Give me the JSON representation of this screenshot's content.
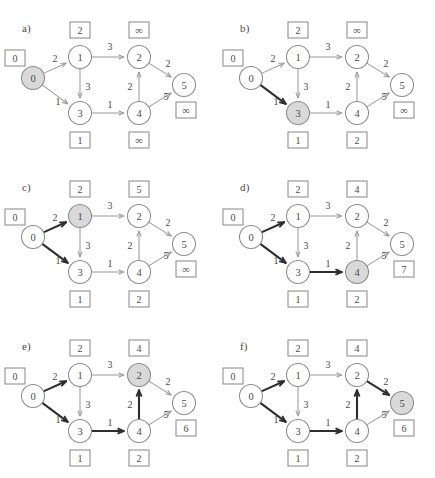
{
  "figure": {
    "width": 435,
    "height": 478,
    "background": "#ffffff",
    "stroke_color": "#8c8c8c",
    "bold_stroke_color": "#2e2e2e",
    "shaded_node_fill": "#d9d9d9",
    "text_color": "#4a4a4a",
    "infinity_glyph": "∞"
  },
  "graph": {
    "nodes": [
      {
        "id": "0",
        "label": "0",
        "x": 33,
        "y": 78
      },
      {
        "id": "1",
        "label": "1",
        "x": 80,
        "y": 57
      },
      {
        "id": "2",
        "label": "2",
        "x": 139,
        "y": 57
      },
      {
        "id": "3",
        "label": "3",
        "x": 80,
        "y": 113
      },
      {
        "id": "4",
        "label": "4",
        "x": 139,
        "y": 113
      },
      {
        "id": "5",
        "label": "5",
        "x": 184,
        "y": 85
      }
    ],
    "edges": [
      {
        "from": "0",
        "to": "1",
        "weight": "2",
        "wx": 55,
        "wy": 58
      },
      {
        "from": "0",
        "to": "3",
        "weight": "1",
        "wx": 58,
        "wy": 101
      },
      {
        "from": "1",
        "to": "2",
        "weight": "3",
        "wx": 110,
        "wy": 46
      },
      {
        "from": "1",
        "to": "3",
        "weight": "3",
        "wx": 88,
        "wy": 86
      },
      {
        "from": "3",
        "to": "4",
        "weight": "1",
        "wx": 110,
        "wy": 104
      },
      {
        "from": "4",
        "to": "2",
        "weight": "2",
        "wx": 130,
        "wy": 86
      },
      {
        "from": "2",
        "to": "5",
        "weight": "2",
        "wx": 168,
        "wy": 63
      },
      {
        "from": "4",
        "to": "5",
        "weight": "5",
        "wx": 166,
        "wy": 96
      }
    ],
    "label_box_positions": {
      "0": {
        "x": 15,
        "y": 58
      },
      "1": {
        "x": 80,
        "y": 30
      },
      "2": {
        "x": 139,
        "y": 30
      },
      "3": {
        "x": 80,
        "y": 140
      },
      "4": {
        "x": 139,
        "y": 140
      },
      "5": {
        "x": 186,
        "y": 110
      }
    }
  },
  "panels": [
    {
      "id": "a",
      "label": "a)",
      "x": 0,
      "y": 0,
      "shaded_node": "0",
      "bold_edges": [],
      "distances": {
        "0": "0",
        "1": "2",
        "2": "∞",
        "3": "1",
        "4": "∞",
        "5": "∞"
      }
    },
    {
      "id": "b",
      "label": "b)",
      "x": 218,
      "y": 0,
      "shaded_node": "3",
      "bold_edges": [
        "0-3"
      ],
      "distances": {
        "0": "0",
        "1": "2",
        "2": "∞",
        "3": "1",
        "4": "2",
        "5": "∞"
      }
    },
    {
      "id": "c",
      "label": "c)",
      "x": 0,
      "y": 159,
      "shaded_node": "1",
      "bold_edges": [
        "0-1",
        "0-3"
      ],
      "distances": {
        "0": "0",
        "1": "2",
        "2": "5",
        "3": "1",
        "4": "2",
        "5": "∞"
      }
    },
    {
      "id": "d",
      "label": "d)",
      "x": 218,
      "y": 159,
      "shaded_node": "4",
      "bold_edges": [
        "0-1",
        "0-3",
        "3-4"
      ],
      "distances": {
        "0": "0",
        "1": "2",
        "2": "4",
        "3": "1",
        "4": "2",
        "5": "7"
      }
    },
    {
      "id": "e",
      "label": "e)",
      "x": 0,
      "y": 318,
      "shaded_node": "2",
      "bold_edges": [
        "0-1",
        "0-3",
        "3-4",
        "4-2"
      ],
      "distances": {
        "0": "0",
        "1": "2",
        "2": "4",
        "3": "1",
        "4": "2",
        "5": "6"
      }
    },
    {
      "id": "f",
      "label": "f)",
      "x": 218,
      "y": 318,
      "shaded_node": "5",
      "bold_edges": [
        "0-1",
        "0-3",
        "3-4",
        "4-2",
        "2-5"
      ],
      "distances": {
        "0": "0",
        "1": "2",
        "2": "4",
        "3": "1",
        "4": "2",
        "5": "6"
      }
    }
  ]
}
